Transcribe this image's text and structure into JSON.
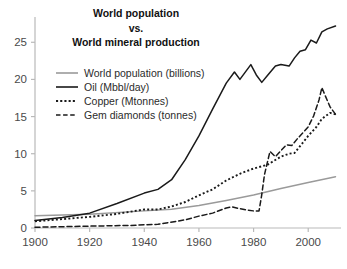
{
  "chart_data": {
    "type": "line",
    "title": "World population\nvs.\nWorld mineral production",
    "title_lines": [
      "World population",
      "vs.",
      "World mineral production"
    ],
    "xlabel": "",
    "ylabel": "",
    "xlim": [
      1900,
      2012
    ],
    "ylim": [
      0,
      28
    ],
    "grid": false,
    "legend_position": "upper-left",
    "xticks": [
      1900,
      1920,
      1940,
      1960,
      1980,
      2000
    ],
    "xtick_labels": [
      "1900",
      "1920",
      "1940",
      "1960",
      "1980",
      "2000"
    ],
    "yticks": [
      0,
      5,
      10,
      15,
      20,
      25
    ],
    "ytick_labels": [
      "0",
      "5",
      "10",
      "15",
      "20",
      "25"
    ],
    "series": [
      {
        "name": "World population (billions)",
        "style": "solid",
        "color": "#9a9a9a",
        "width": 1.4,
        "x": [
          1900,
          1920,
          1940,
          1950,
          1960,
          1970,
          1980,
          1990,
          2000,
          2010
        ],
        "values": [
          1.65,
          1.86,
          2.3,
          2.52,
          3.03,
          3.7,
          4.44,
          5.32,
          6.12,
          6.9
        ]
      },
      {
        "name": "Oil (Mbbl/day)",
        "style": "solid",
        "color": "#1a1a1a",
        "width": 1.5,
        "x": [
          1900,
          1910,
          1920,
          1930,
          1940,
          1945,
          1950,
          1955,
          1960,
          1965,
          1970,
          1973,
          1975,
          1979,
          1981,
          1983,
          1985,
          1988,
          1990,
          1993,
          1995,
          1997,
          1999,
          2001,
          2003,
          2005,
          2007,
          2010
        ],
        "values": [
          1.0,
          1.4,
          2.0,
          3.3,
          4.7,
          5.2,
          6.5,
          9.2,
          12.4,
          16.0,
          19.5,
          21.0,
          20.0,
          22.0,
          20.6,
          19.6,
          20.5,
          21.8,
          22.0,
          21.8,
          22.9,
          23.8,
          24.0,
          25.3,
          24.9,
          26.4,
          26.8,
          27.2
        ]
      },
      {
        "name": "Copper (Mtonnes)",
        "style": "dotted",
        "color": "#1a1a1a",
        "width": 1.9,
        "x": [
          1900,
          1910,
          1920,
          1930,
          1940,
          1945,
          1950,
          1955,
          1960,
          1965,
          1970,
          1975,
          1980,
          1985,
          1990,
          1993,
          1995,
          2000,
          2003,
          2005,
          2008,
          2010
        ],
        "values": [
          0.9,
          1.2,
          1.5,
          1.9,
          2.5,
          2.5,
          2.9,
          3.5,
          4.4,
          5.2,
          6.4,
          7.3,
          8.0,
          8.5,
          9.6,
          10.0,
          10.1,
          12.4,
          13.6,
          14.7,
          15.5,
          15.3
        ]
      },
      {
        "name": "Gem diamonds (tonnes)",
        "style": "dashed",
        "color": "#1a1a1a",
        "width": 1.5,
        "x": [
          1900,
          1920,
          1935,
          1945,
          1955,
          1960,
          1965,
          1970,
          1972,
          1975,
          1978,
          1980,
          1982,
          1983,
          1984,
          1986,
          1988,
          1990,
          1992,
          1994,
          1996,
          1998,
          2000,
          2002,
          2004,
          2005,
          2006,
          2008,
          2010
        ],
        "values": [
          0.1,
          0.25,
          0.35,
          0.5,
          1.1,
          1.6,
          2.0,
          2.7,
          2.85,
          2.6,
          2.4,
          2.3,
          2.3,
          4.5,
          7.2,
          10.3,
          9.6,
          10.4,
          11.2,
          11.1,
          12.0,
          12.8,
          13.6,
          15.1,
          17.3,
          18.9,
          18.0,
          16.3,
          15.3
        ]
      }
    ]
  },
  "axis": {
    "axis_color": "#b9b9b9",
    "tick_text_color": "#4a4a4a"
  }
}
